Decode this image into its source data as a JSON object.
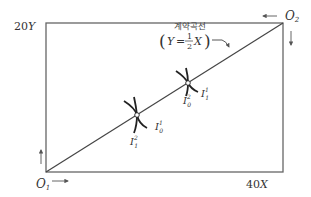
{
  "diagram": {
    "type": "edgeworth-box",
    "colors": {
      "line": "#555555",
      "curve": "#222222",
      "text": "#333333"
    },
    "labels": {
      "y_max_num": "20",
      "y_max_var": "Y",
      "x_max_num": "40",
      "x_max_var": "X",
      "origin1": "O",
      "origin1_sub": "1",
      "origin2": "O",
      "origin2_sub": "2"
    },
    "contract_curve": {
      "title": "계약곡선",
      "eq_lhs": "Y",
      "eq_eq": "=",
      "eq_num": "1",
      "eq_den": "2",
      "eq_rhs": "X"
    },
    "tangency_points": [
      {
        "name": "lower",
        "ic_a": {
          "base": "I",
          "sup": "1",
          "sub": "0"
        },
        "ic_b": {
          "base": "I",
          "sup": "2",
          "sub": "1"
        }
      },
      {
        "name": "upper",
        "ic_a": {
          "base": "I",
          "sup": "1",
          "sub": "1"
        },
        "ic_b": {
          "base": "I",
          "sup": "2",
          "sub": "0"
        }
      }
    ]
  }
}
